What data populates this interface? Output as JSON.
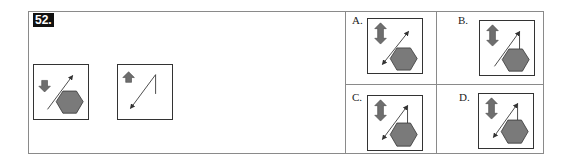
{
  "question": {
    "number": "52.",
    "figures": [
      {
        "id": "q1",
        "arrow_block": "down",
        "line": "arrow-up-right",
        "hexagon": true
      },
      {
        "id": "q2",
        "arrow_block": "up",
        "line": "arrow-down-left-with-vertical-tick",
        "hexagon": false
      }
    ]
  },
  "options": [
    {
      "label": "A.",
      "arrow_block": "up-down",
      "line": "double-arrow",
      "hexagon": true
    },
    {
      "label": "B.",
      "arrow_block": "up-down",
      "line": "arrow-up-right-with-tick",
      "hexagon": true
    },
    {
      "label": "C.",
      "arrow_block": "up-down",
      "line": "double-arrow-with-tick",
      "hexagon": true
    },
    {
      "label": "D.",
      "arrow_block": "up-down",
      "line": "double-arrow-with-tick",
      "hexagon": true
    }
  ],
  "colors": {
    "hexagon_fill": "#7a7a7a",
    "arrow_fill": "#6e6e6e",
    "line": "#333333",
    "border": "#8a8a8a"
  }
}
